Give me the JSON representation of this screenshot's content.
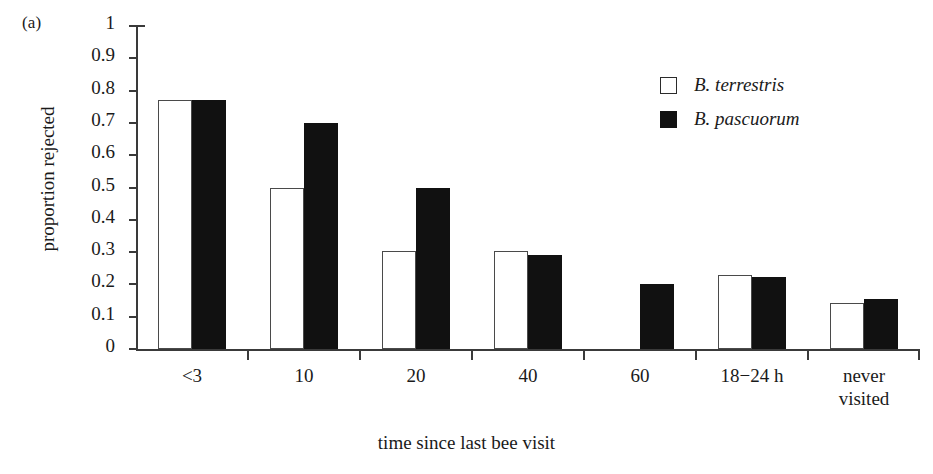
{
  "panel": {
    "label": "(a)"
  },
  "chart_data": {
    "type": "bar",
    "title": "",
    "subtitle": "",
    "xlabel": "time since last bee visit",
    "ylabel": "proportion rejected",
    "categories": [
      "<3",
      "10",
      "20",
      "40",
      "60",
      "18−24 h",
      "never\nvisited"
    ],
    "series": [
      {
        "name": "B. terrestris",
        "style": "open",
        "color": "#ffffff",
        "edge_color": "#4a4a4a",
        "values": [
          0.77,
          0.5,
          0.305,
          0.305,
          null,
          0.228,
          0.144
        ]
      },
      {
        "name": "B. pascuorum",
        "style": "filled",
        "color": "#111111",
        "edge_color": "#111111",
        "values": [
          0.77,
          0.7,
          0.5,
          0.29,
          0.2,
          0.223,
          0.155
        ]
      }
    ],
    "ylim": [
      0,
      1
    ],
    "ytick_values": [
      0,
      0.1,
      0.2,
      0.3,
      0.4,
      0.5,
      0.6,
      0.7,
      0.8,
      0.9,
      1
    ],
    "ytick_labels": [
      "0",
      "0.1",
      "0.2",
      "0.3",
      "0.4",
      "0.5",
      "0.6",
      "0.7",
      "0.8",
      "0.9",
      "1"
    ],
    "grid": false,
    "legend_position": "top-right",
    "legend_italic": true
  },
  "legend": {
    "entries": [
      {
        "label": "B. terrestris",
        "swatch": "open-square-icon"
      },
      {
        "label": "B. pascuorum",
        "swatch": "filled-square-icon"
      }
    ]
  }
}
